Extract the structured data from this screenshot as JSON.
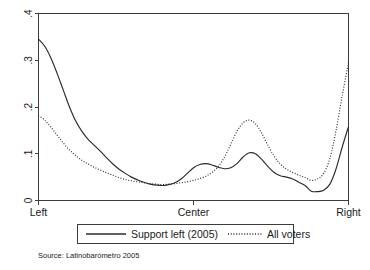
{
  "chart_data": {
    "type": "line",
    "title": "",
    "xlabel": "",
    "ylabel": "",
    "xlim": [
      0,
      10
    ],
    "ylim": [
      0,
      0.4
    ],
    "grid": false,
    "legend_position": "below-axis",
    "x_tick_labels": [
      "Left",
      "Center",
      "Right"
    ],
    "x_tick_values": [
      0,
      5,
      10
    ],
    "y_tick_labels": [
      "0",
      ".1",
      ".2",
      ".3",
      ".4"
    ],
    "y_tick_values": [
      0,
      0.1,
      0.2,
      0.3,
      0.4
    ],
    "x": [
      0.0,
      0.2,
      0.4,
      0.6,
      0.8,
      1.0,
      1.2,
      1.4,
      1.6,
      1.8,
      2.0,
      2.2,
      2.4,
      2.6,
      2.8,
      3.0,
      3.2,
      3.4,
      3.6,
      3.8,
      4.0,
      4.2,
      4.4,
      4.6,
      4.8,
      5.0,
      5.2,
      5.4,
      5.6,
      5.8,
      6.0,
      6.2,
      6.4,
      6.6,
      6.8,
      7.0,
      7.2,
      7.4,
      7.6,
      7.8,
      8.0,
      8.2,
      8.4,
      8.6,
      8.8,
      9.0,
      9.2,
      9.4,
      9.6,
      9.8,
      10.0
    ],
    "series": [
      {
        "name": "Support left (2005)",
        "style": "solid",
        "values": [
          0.345,
          0.33,
          0.305,
          0.272,
          0.236,
          0.2,
          0.17,
          0.148,
          0.131,
          0.118,
          0.105,
          0.091,
          0.078,
          0.067,
          0.058,
          0.05,
          0.044,
          0.039,
          0.035,
          0.033,
          0.032,
          0.034,
          0.038,
          0.046,
          0.058,
          0.07,
          0.077,
          0.079,
          0.076,
          0.071,
          0.068,
          0.07,
          0.079,
          0.093,
          0.102,
          0.1,
          0.088,
          0.073,
          0.06,
          0.053,
          0.05,
          0.046,
          0.039,
          0.032,
          0.026,
          0.022,
          0.018,
          0.016,
          0.016,
          0.018,
          0.023
        ]
      },
      {
        "name": "All voters",
        "style": "dotted",
        "values": [
          0.182,
          0.172,
          0.157,
          0.14,
          0.123,
          0.108,
          0.096,
          0.086,
          0.078,
          0.071,
          0.065,
          0.059,
          0.054,
          0.049,
          0.045,
          0.042,
          0.04,
          0.038,
          0.036,
          0.035,
          0.034,
          0.035,
          0.036,
          0.038,
          0.04,
          0.043,
          0.047,
          0.052,
          0.06,
          0.073,
          0.093,
          0.12,
          0.148,
          0.166,
          0.172,
          0.164,
          0.144,
          0.118,
          0.095,
          0.078,
          0.067,
          0.06,
          0.054,
          0.049,
          0.045,
          0.043,
          0.041,
          0.04,
          0.04,
          0.041,
          0.043
        ]
      }
    ],
    "series_tail": {
      "note": "Both series rise steeply near the Right end",
      "x_tail": [
        8.8,
        9.0,
        9.2,
        9.4,
        9.6,
        9.8,
        10.0
      ],
      "solid_tail": [
        0.02,
        0.019,
        0.022,
        0.035,
        0.068,
        0.115,
        0.158
      ],
      "dotted_tail": [
        0.043,
        0.046,
        0.058,
        0.09,
        0.15,
        0.225,
        0.295
      ]
    },
    "secondary_bumps": {
      "solid_pre_center_bump_x": 5.4,
      "solid_pre_center_bump_y": 0.079,
      "solid_center_peak_x": 6.8,
      "solid_center_peak_y": 0.103,
      "dotted_center_peak_x": 6.8,
      "dotted_center_peak_y": 0.172,
      "dotted_right_bump_x": 8.3,
      "dotted_right_bump_y": 0.047
    },
    "annotations": []
  },
  "legend": {
    "items": [
      {
        "label": "Support left (2005)",
        "style": "solid"
      },
      {
        "label": "All voters",
        "style": "dotted"
      }
    ]
  },
  "footer": {
    "source": "Source: Latinobarómetro 2005"
  },
  "colors": {
    "line": "#2b2b2b",
    "axis": "#3c3c3c",
    "background": "#ffffff",
    "text": "#1a1a1a"
  }
}
